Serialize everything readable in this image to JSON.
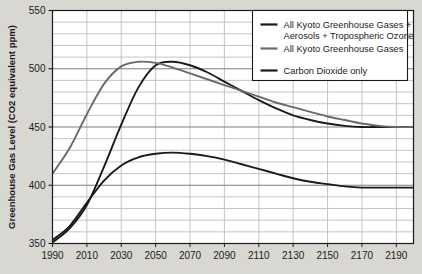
{
  "chart_data": {
    "type": "line",
    "title": "",
    "xlabel": "",
    "ylabel": "Greenhouse Gas Level (CO2 equivalent ppm)",
    "xlim": [
      1990,
      2200
    ],
    "ylim": [
      350,
      550
    ],
    "xticks": [
      1990,
      2010,
      2030,
      2050,
      2070,
      2090,
      2110,
      2130,
      2150,
      2170,
      2190
    ],
    "yticks": [
      350,
      400,
      450,
      500,
      550
    ],
    "y_minor_step": 10,
    "grid": true,
    "legend_position": "top-right",
    "series": [
      {
        "name": "All Kyoto Greenhouse Gases + Aerosols + Tropospheric Ozone",
        "color": "#1a1a1a",
        "x": [
          1990,
          2000,
          2010,
          2020,
          2030,
          2040,
          2050,
          2060,
          2070,
          2080,
          2090,
          2100,
          2110,
          2120,
          2130,
          2140,
          2150,
          2160,
          2170,
          2180,
          2190,
          2200
        ],
        "y": [
          351,
          363,
          383,
          416,
          452,
          484,
          503,
          506,
          503,
          497,
          489,
          481,
          473,
          466,
          460,
          456,
          453,
          451,
          450,
          450,
          450,
          450
        ]
      },
      {
        "name": "All Kyoto Greenhouse Gases",
        "color": "#6a6a6a",
        "x": [
          1990,
          2000,
          2010,
          2020,
          2030,
          2040,
          2050,
          2060,
          2070,
          2080,
          2090,
          2100,
          2110,
          2120,
          2130,
          2140,
          2150,
          2160,
          2170,
          2180,
          2190,
          2200
        ],
        "y": [
          410,
          432,
          461,
          487,
          502,
          506,
          505,
          501,
          496,
          491,
          486,
          481,
          476,
          471,
          467,
          463,
          459,
          456,
          453,
          451,
          450,
          450
        ]
      },
      {
        "name": "Carbon Dioxide only",
        "color": "#1a1a1a",
        "x": [
          1990,
          2000,
          2010,
          2020,
          2030,
          2040,
          2050,
          2060,
          2070,
          2080,
          2090,
          2100,
          2110,
          2120,
          2130,
          2140,
          2150,
          2160,
          2170,
          2180,
          2190,
          2200
        ],
        "y": [
          353,
          365,
          385,
          404,
          417,
          424,
          427,
          428,
          427,
          425,
          422,
          418,
          414,
          410,
          406,
          403,
          401,
          399,
          398,
          398,
          398,
          398
        ]
      }
    ]
  },
  "legend": {
    "entries": [
      {
        "label_line1": "All Kyoto Greenhouse Gases +",
        "label_line2": "Aerosols + Tropospheric Ozone",
        "color": "#1a1a1a"
      },
      {
        "label_line1": "All Kyoto Greenhouse Gases",
        "label_line2": "",
        "color": "#6a6a6a"
      },
      {
        "label_line1": "Carbon Dioxide only",
        "label_line2": "",
        "color": "#1a1a1a"
      }
    ]
  },
  "colors": {
    "page_background": "#d9d7d2",
    "plot_background": "#ffffff",
    "grid_minor": "#bdbdbd",
    "grid_major": "#7d7d7d",
    "axis": "#1b1b1b",
    "text": "#1b1b1b"
  }
}
